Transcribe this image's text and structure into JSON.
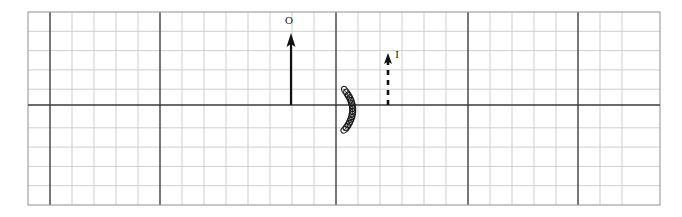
{
  "figure": {
    "title": "",
    "background_color": "#ffffff",
    "canvas": {
      "width": 682,
      "height": 217
    }
  },
  "grid": {
    "description": "graph-paper grid",
    "left": 28,
    "top": 12,
    "right": 660,
    "bottom": 205,
    "cell_width": 22,
    "cell_height": 19.3,
    "columns": 28,
    "rows": 10,
    "minor_color": "#c9c9c9",
    "major_color": "#4a4a4a",
    "border_color": "#9a9a9a",
    "major_every_columns": 5,
    "major_every_rows": 5,
    "major_column_indices": [
      1,
      6,
      14,
      20,
      25
    ],
    "major_row_indices": [
      5
    ]
  },
  "elements": {
    "axis": {
      "name": "horizontal-axis",
      "y": 105,
      "x_start": 28,
      "x_end": 660,
      "color": "#3a3a3a",
      "width": 1.6
    },
    "solid_arrow": {
      "name": "velocity-arrow",
      "label": "O",
      "x": 291,
      "y_tail": 105,
      "y_head": 33,
      "color": "#111111",
      "stroke_width": 2.2,
      "head_width": 9,
      "head_length": 14,
      "style": "solid",
      "label_x": 289,
      "label_y": 24
    },
    "dashed_arrow": {
      "name": "current-arrow",
      "label": "I",
      "x": 388,
      "y_tail": 105,
      "y_head": 53,
      "color": "#111111",
      "stroke_width": 2.6,
      "head_width": 8,
      "head_length": 11,
      "style": "dashed",
      "dash_pattern": "5,5",
      "label_x": 397,
      "label_y": 58
    },
    "coil": {
      "name": "solenoid-coil",
      "x_center": 345,
      "y_top": 89,
      "y_bottom": 131,
      "bulge": 9,
      "turns": 15,
      "color": "#1a1a1a",
      "stroke_width": 1.1,
      "loop_rx": 3.2,
      "loop_ry": 1.5
    }
  },
  "labels": {
    "o_label": "O",
    "i_label": "I"
  }
}
